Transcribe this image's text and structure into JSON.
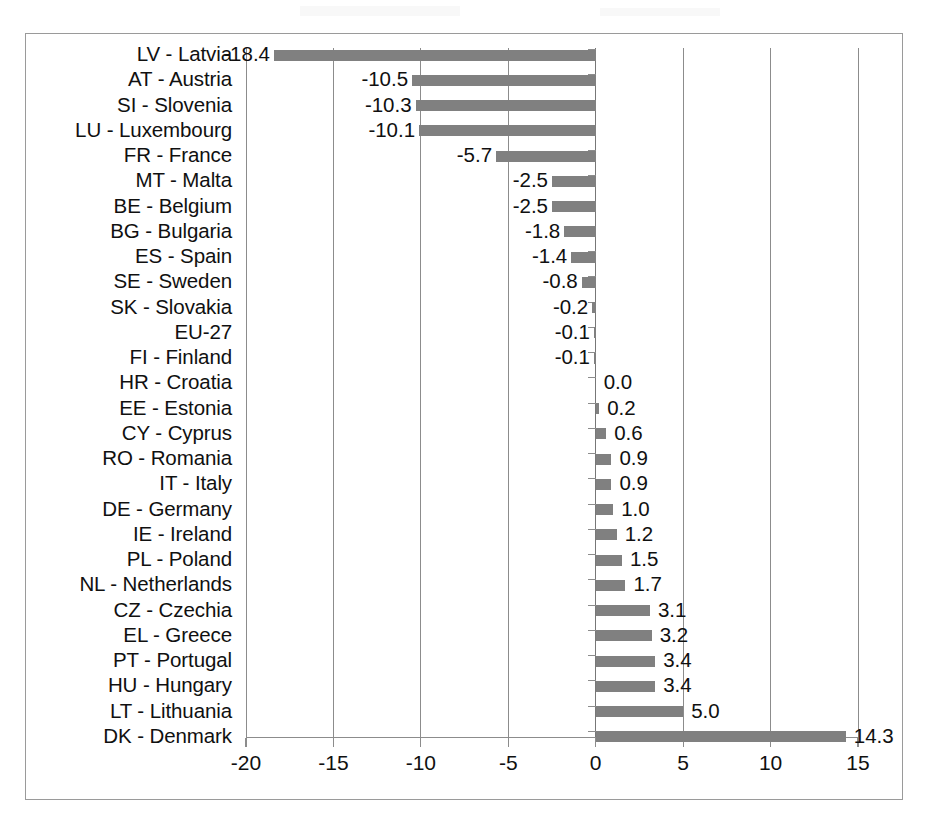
{
  "chart_data": {
    "type": "bar",
    "orientation": "horizontal",
    "title": "",
    "subtitle": "",
    "xlabel": "",
    "ylabel": "",
    "xlim": [
      -20,
      15
    ],
    "xticks": [
      -20,
      -15,
      -10,
      -5,
      0,
      5,
      10,
      15
    ],
    "xtick_labels": [
      "-20",
      "-15",
      "-10",
      "-5",
      "0",
      "5",
      "10",
      "15"
    ],
    "grid": true,
    "legend": null,
    "bar_color": "#808080",
    "categories": [
      "LV - Latvia",
      "AT - Austria",
      "SI - Slovenia",
      "LU - Luxembourg",
      "FR - France",
      "MT - Malta",
      "BE - Belgium",
      "BG - Bulgaria",
      "ES - Spain",
      "SE - Sweden",
      "SK - Slovakia",
      "EU-27",
      "FI - Finland",
      "HR - Croatia",
      "EE - Estonia",
      "CY - Cyprus",
      "RO - Romania",
      "IT - Italy",
      "DE - Germany",
      "IE - Ireland",
      "PL - Poland",
      "NL - Netherlands",
      "CZ - Czechia",
      "EL - Greece",
      "PT - Portugal",
      "HU - Hungary",
      "LT - Lithuania",
      "DK - Denmark"
    ],
    "values": [
      -18.4,
      -10.5,
      -10.3,
      -10.1,
      -5.7,
      -2.5,
      -2.5,
      -1.8,
      -1.4,
      -0.8,
      -0.2,
      -0.1,
      -0.1,
      0.0,
      0.2,
      0.6,
      0.9,
      0.9,
      1.0,
      1.2,
      1.5,
      1.7,
      3.1,
      3.2,
      3.4,
      3.4,
      5.0,
      14.3
    ],
    "value_labels": [
      "-18.4",
      "-10.5",
      "-10.3",
      "-10.1",
      "-5.7",
      "-2.5",
      "-2.5",
      "-1.8",
      "-1.4",
      "-0.8",
      "-0.2",
      "-0.1",
      "-0.1",
      "0.0",
      "0.2",
      "0.6",
      "0.9",
      "0.9",
      "1.0",
      "1.2",
      "1.5",
      "1.7",
      "3.1",
      "3.2",
      "3.4",
      "3.4",
      "5.0",
      "14.3"
    ]
  }
}
